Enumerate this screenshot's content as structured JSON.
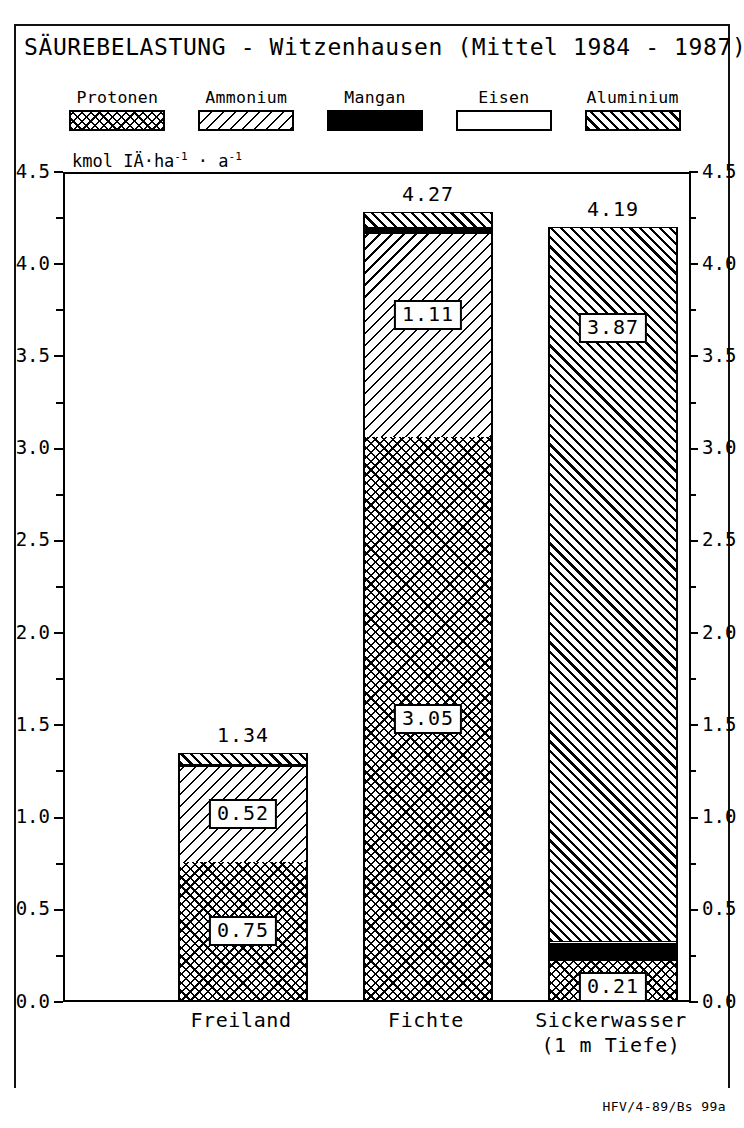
{
  "chart_data": {
    "type": "bar",
    "subtype": "stacked",
    "title": "SÄUREBELASTUNG - Witzenhausen (Mittel 1984 - 1987)",
    "ylabel": "kmol IÄ·ha-1 · a-1",
    "ylabel_parts": {
      "prefix": "kmol IÄ·ha",
      "exp1": "-1",
      "mid": " · a",
      "exp2": "-1"
    },
    "xlabel": "",
    "ylim": [
      0.0,
      4.5
    ],
    "ytick_step": 0.5,
    "yminor_step": 0.25,
    "grid": false,
    "legend_position": "top",
    "categories": [
      "Freiland",
      "Fichte",
      "Sickerwasser"
    ],
    "category_sublabels": [
      "",
      "",
      "(1 m Tiefe)"
    ],
    "ytick_labels": [
      "0.0",
      "0.5",
      "1.0",
      "1.5",
      "2.0",
      "2.5",
      "3.0",
      "3.5",
      "4.0",
      "4.5"
    ],
    "series": [
      {
        "name": "Protonen",
        "pattern": "cross-hatch",
        "values": [
          0.75,
          3.05,
          0.21
        ]
      },
      {
        "name": "Ammonium",
        "pattern": "diagonal-hatch",
        "values": [
          0.52,
          1.11,
          0.0
        ]
      },
      {
        "name": "Mangan",
        "pattern": "solid-black",
        "values": [
          0.01,
          0.03,
          0.1
        ]
      },
      {
        "name": "Eisen",
        "pattern": "empty-white",
        "values": [
          0.0,
          0.0,
          0.01
        ]
      },
      {
        "name": "Aluminium",
        "pattern": "dense-diagonal",
        "values": [
          0.06,
          0.08,
          3.87
        ]
      }
    ],
    "totals": [
      "1.34",
      "4.27",
      "4.19"
    ],
    "labeled_segments": {
      "Freiland": [
        {
          "series": "Protonen",
          "label": "0.75"
        },
        {
          "series": "Ammonium",
          "label": "0.52"
        }
      ],
      "Fichte": [
        {
          "series": "Protonen",
          "label": "3.05"
        },
        {
          "series": "Ammonium",
          "label": "1.11"
        }
      ],
      "Sickerwasser": [
        {
          "series": "Protonen",
          "label": "0.21"
        },
        {
          "series": "Aluminium",
          "label": "3.87"
        }
      ]
    }
  },
  "legend": {
    "items": [
      {
        "label": "Protonen",
        "pattern": "cross-hatch"
      },
      {
        "label": "Ammonium",
        "pattern": "diagonal-hatch"
      },
      {
        "label": "Mangan",
        "pattern": "solid-black"
      },
      {
        "label": "Eisen",
        "pattern": "empty-white"
      },
      {
        "label": "Aluminium",
        "pattern": "dense-diagonal"
      }
    ]
  },
  "footer": {
    "code": "HFV/4-89/Bs  99a"
  },
  "colors": {
    "ink": "#000000",
    "paper": "#ffffff"
  }
}
